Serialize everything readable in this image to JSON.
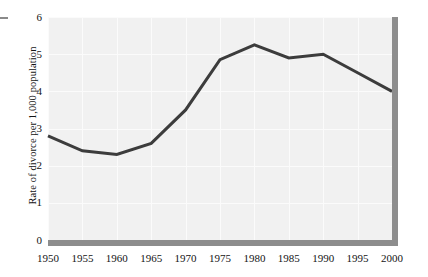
{
  "chart_data": {
    "type": "line",
    "title": "",
    "subtitle": "",
    "xlabel": "",
    "ylabel": "Rate of divorce per 1,000 population",
    "x": [
      1950,
      1955,
      1960,
      1965,
      1970,
      1975,
      1980,
      1985,
      1990,
      1995,
      2000
    ],
    "categories": [
      "1950",
      "1955",
      "1960",
      "1965",
      "1970",
      "1975",
      "1980",
      "1985",
      "1990",
      "1995",
      "2000"
    ],
    "values": [
      2.8,
      2.4,
      2.3,
      2.6,
      3.5,
      4.85,
      5.25,
      4.9,
      5.0,
      4.5,
      4.0
    ],
    "series": [
      {
        "name": "Rate of divorce per 1,000 population",
        "values": [
          2.8,
          2.4,
          2.3,
          2.6,
          3.5,
          4.85,
          5.25,
          4.9,
          5.0,
          4.5,
          4.0
        ]
      }
    ],
    "xlim": [
      1950,
      2000
    ],
    "ylim": [
      0,
      6
    ],
    "yticks": [
      0,
      1,
      2,
      3,
      4,
      5,
      6
    ],
    "ytick_labels": [
      "0",
      "1",
      "2",
      "3",
      "4",
      "5",
      "6"
    ],
    "xticks": [
      1950,
      1955,
      1960,
      1965,
      1970,
      1975,
      1980,
      1985,
      1990,
      1995,
      2000
    ],
    "xtick_labels": [
      "1950",
      "1955",
      "1960",
      "1965",
      "1970",
      "1975",
      "1980",
      "1985",
      "1990",
      "1995",
      "2000"
    ],
    "grid": true,
    "grid_color": "#fbfbfb",
    "legend": false,
    "legend_position": "none",
    "plot_background": "#f1f1f1",
    "line_color": "#3c3c3c",
    "line_width": 3,
    "axis_border_color": "#8d8d8d",
    "annotations": []
  }
}
